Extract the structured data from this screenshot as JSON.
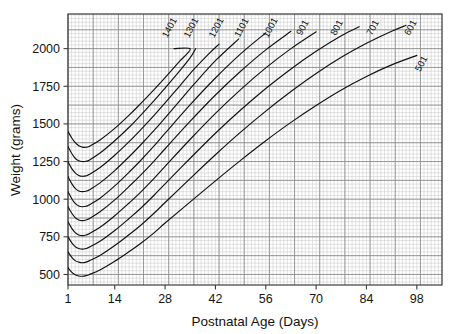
{
  "chart_data": {
    "type": "line",
    "title": "",
    "xlabel": "Postnatal Age (Days)",
    "ylabel": "Weight (grams)",
    "xlim": [
      1,
      105
    ],
    "ylim": [
      430,
      2230
    ],
    "xticks": [
      1,
      14,
      28,
      42,
      56,
      70,
      84,
      98
    ],
    "xtick_labels": [
      "1",
      "14",
      "28",
      "42",
      "56",
      "70",
      "84",
      "98"
    ],
    "yticks": [
      500,
      750,
      1000,
      1250,
      1500,
      1750,
      2000
    ],
    "ytick_labels": [
      "500",
      "750",
      "1000",
      "1250",
      "1500",
      "1750",
      "2000"
    ],
    "grid": true,
    "grid_major_x_step": 7,
    "grid_minor_x_step": 1,
    "grid_major_y_step": 125,
    "grid_minor_y_step": 25,
    "legend_position": "inline-curve-labels",
    "legend_note": "Each curve is labelled at its upper end with the birth-weight band upper bound in grams",
    "series": [
      {
        "name": "1401",
        "label": "1401",
        "birth_weight_band": "1301-1500 g",
        "label_x": 30,
        "label_y": 2130,
        "x": [
          1,
          2,
          3,
          4,
          5,
          6,
          7,
          10,
          14,
          18,
          21,
          25,
          28,
          32,
          35,
          30.5
        ],
        "y": [
          1450,
          1408,
          1375,
          1355,
          1346,
          1345,
          1352,
          1395,
          1470,
          1558,
          1630,
          1730,
          1808,
          1915,
          1998,
          2000
        ]
      },
      {
        "name": "1301",
        "label": "1301",
        "birth_weight_band": "1201-1400 g",
        "label_x": 36,
        "label_y": 2130,
        "x": [
          1,
          2,
          3,
          4,
          5,
          6,
          7,
          10,
          14,
          18,
          21,
          25,
          28,
          32,
          35,
          36.5
        ],
        "y": [
          1350,
          1305,
          1272,
          1255,
          1250,
          1252,
          1261,
          1308,
          1388,
          1478,
          1552,
          1656,
          1738,
          1850,
          1940,
          2000
        ]
      },
      {
        "name": "1201",
        "label": "1201",
        "birth_weight_band": "1101-1300 g",
        "label_x": 43,
        "label_y": 2130,
        "x": [
          1,
          2,
          3,
          4,
          5,
          6,
          7,
          10,
          14,
          18,
          21,
          25,
          28,
          32,
          36,
          40,
          43
        ],
        "y": [
          1250,
          1205,
          1175,
          1158,
          1152,
          1155,
          1165,
          1212,
          1292,
          1382,
          1455,
          1558,
          1640,
          1750,
          1862,
          1962,
          2030
        ]
      },
      {
        "name": "1101",
        "label": "1101",
        "birth_weight_band": "1001-1200 g",
        "label_x": 50,
        "label_y": 2130,
        "x": [
          1,
          2,
          3,
          4,
          5,
          6,
          7,
          10,
          14,
          18,
          21,
          25,
          28,
          32,
          36,
          42,
          48.5
        ],
        "y": [
          1150,
          1105,
          1072,
          1055,
          1050,
          1053,
          1063,
          1110,
          1190,
          1282,
          1355,
          1458,
          1540,
          1652,
          1762,
          1920,
          2065
        ]
      },
      {
        "name": "1001",
        "label": "1001",
        "birth_weight_band": "901-1100 g",
        "label_x": 58,
        "label_y": 2130,
        "x": [
          1,
          2,
          3,
          4,
          5,
          6,
          7,
          10,
          14,
          18,
          21,
          25,
          28,
          35,
          42,
          49,
          56
        ],
        "y": [
          1050,
          1005,
          972,
          955,
          950,
          953,
          963,
          1008,
          1088,
          1180,
          1252,
          1355,
          1438,
          1628,
          1805,
          1965,
          2105
        ]
      },
      {
        "name": "901",
        "label": "901",
        "birth_weight_band": "801-1000 g",
        "label_x": 67,
        "label_y": 2130,
        "x": [
          1,
          2,
          3,
          4,
          5,
          6,
          7,
          10,
          14,
          18,
          21,
          25,
          28,
          35,
          42,
          49,
          56,
          63
        ],
        "y": [
          950,
          908,
          878,
          862,
          858,
          862,
          872,
          918,
          995,
          1085,
          1155,
          1255,
          1335,
          1518,
          1692,
          1850,
          1992,
          2115
        ]
      },
      {
        "name": "801",
        "label": "801",
        "birth_weight_band": "701-900 g",
        "label_x": 76.5,
        "label_y": 2130,
        "x": [
          1,
          2,
          3,
          4,
          5,
          6,
          7,
          10,
          14,
          18,
          21,
          25,
          28,
          35,
          42,
          49,
          56,
          63,
          70
        ],
        "y": [
          850,
          808,
          778,
          762,
          758,
          762,
          772,
          815,
          890,
          975,
          1042,
          1140,
          1218,
          1398,
          1570,
          1728,
          1872,
          2000,
          2112
        ]
      },
      {
        "name": "701",
        "label": "701",
        "birth_weight_band": "601-800 g",
        "label_x": 86.5,
        "label_y": 2130,
        "x": [
          1,
          2,
          3,
          4,
          5,
          6,
          7,
          10,
          14,
          18,
          21,
          25,
          28,
          35,
          42,
          49,
          56,
          63,
          70,
          77,
          82
        ],
        "y": [
          750,
          712,
          685,
          672,
          668,
          672,
          682,
          722,
          792,
          872,
          935,
          1028,
          1102,
          1272,
          1438,
          1592,
          1735,
          1865,
          1982,
          2085,
          2145
        ]
      },
      {
        "name": "601",
        "label": "601",
        "birth_weight_band": "501-700 g",
        "label_x": 97,
        "label_y": 2130,
        "x": [
          1,
          2,
          3,
          4,
          5,
          6,
          7,
          10,
          14,
          18,
          21,
          25,
          28,
          35,
          42,
          49,
          56,
          63,
          70,
          77,
          84,
          91,
          95
        ],
        "y": [
          650,
          615,
          592,
          582,
          578,
          582,
          592,
          628,
          692,
          765,
          822,
          908,
          978,
          1138,
          1295,
          1445,
          1585,
          1715,
          1835,
          1942,
          2035,
          2115,
          2155
        ]
      },
      {
        "name": "501",
        "label": "501",
        "birth_weight_band": "401-600 g",
        "label_x": 100,
        "label_y": 1890,
        "x": [
          1,
          2,
          3,
          4,
          5,
          6,
          7,
          10,
          14,
          18,
          21,
          25,
          28,
          35,
          42,
          49,
          56,
          63,
          70,
          77,
          84,
          91,
          98
        ],
        "y": [
          545,
          515,
          498,
          490,
          488,
          492,
          500,
          532,
          588,
          652,
          702,
          778,
          842,
          982,
          1122,
          1258,
          1388,
          1510,
          1622,
          1725,
          1815,
          1892,
          1955
        ]
      }
    ]
  },
  "colors": {
    "curve": "#111111",
    "frame": "#3c3c3c",
    "grid_major": "#8a8a8a",
    "grid_minor": "#c9c9c9",
    "text": "#141414",
    "background": "#ffffff"
  }
}
